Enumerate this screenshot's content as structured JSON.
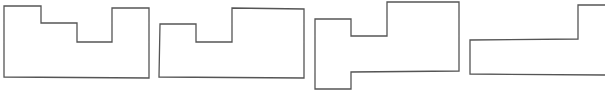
{
  "figure": {
    "width": 605,
    "height": 92,
    "stroke_color": "#555555",
    "background": "#ffffff",
    "shapes": [
      {
        "id": "shape-1",
        "description": "Rectangle with two-step notch cut from top",
        "points": "4,6 41,6 41,23 77,23 77,42 112,42 112,8 149,8 149,78 4,77"
      },
      {
        "id": "shape-2",
        "description": "Rectangle with single notch on top and raised right block",
        "points": "160,24 196,24 196,42 232,42 232,8 304,9 304,78 159,77"
      },
      {
        "id": "shape-3",
        "description": "Z-like stepped polygon extending downward on left",
        "points": "315,19 351,19 351,36 387,36 387,2 459,2 459,71 351,72 351,89 315,89"
      },
      {
        "id": "shape-4",
        "description": "Stepped polygon clipped at right edge",
        "points": "605,5 578,5 578,39 470,40 470,74 605,75"
      }
    ]
  }
}
